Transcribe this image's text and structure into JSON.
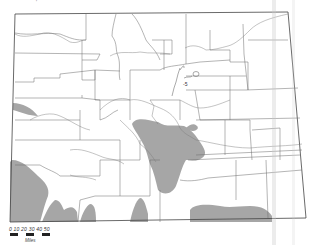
{
  "map": {
    "region": "Colorado",
    "features": {
      "state_outline": true,
      "county_boundaries": true,
      "rivers": true,
      "shaded_areas": "distribution zones (gray)"
    },
    "labels": {
      "top_marker": "'",
      "city_marker": "-5"
    },
    "colors": {
      "boundary": "#555555",
      "shade": "#9a9a9a",
      "background": "#ffffff"
    }
  },
  "scale_bar": {
    "ticks": "0  10  20  30  40  50",
    "unit": "Miles"
  }
}
